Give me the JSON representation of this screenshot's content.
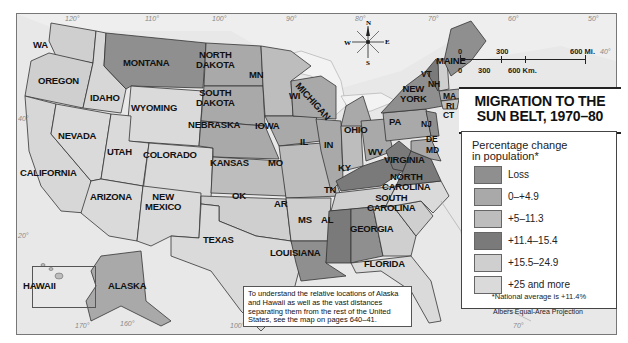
{
  "title": {
    "line1": "MIGRATION TO THE",
    "line2": "SUN BELT, 1970–80"
  },
  "scale": {
    "miles": [
      "0",
      "300",
      "600 Mi."
    ],
    "km": [
      "0",
      "300",
      "600 Km."
    ]
  },
  "compass": {
    "n": "N",
    "s": "S",
    "e": "E",
    "w": "W"
  },
  "legend": {
    "heading1": "Percentage change",
    "heading2": "in population*",
    "items": [
      {
        "label": "Loss",
        "color": "#8f8f8f"
      },
      {
        "label": "0–+4.9",
        "color": "#a9a9a9"
      },
      {
        "label": "+5–11.3",
        "color": "#bdbdbd"
      },
      {
        "label": "+11.4–15.4",
        "color": "#7a7a7a"
      },
      {
        "label": "+15.5–24.9",
        "color": "#cfcfcf"
      },
      {
        "label": "+25 and more",
        "color": "#dadada"
      }
    ],
    "note": "*National average is +11.4%",
    "projection": "Albers Equal-Area Projection"
  },
  "caption": "To understand the relative locations of Alaska and Hawaii as well as the vast distances separating them from the rest of the United States, see the map on pages 640–41.",
  "longitudes": [
    "120°",
    "110°",
    "100°",
    "90°",
    "80°",
    "70°",
    "60°",
    "50°",
    "40°",
    "30°",
    "100°",
    "70°",
    "160°",
    "170°",
    "110°",
    "160°",
    "20°",
    "60°",
    "70°"
  ],
  "latitudes": [
    "40°",
    "20°",
    "50°"
  ],
  "states": {
    "wa": "WA",
    "oregon": "OREGON",
    "california": "CALIFORNIA",
    "idaho": "IDAHO",
    "nevada": "NEVADA",
    "montana": "MONTANA",
    "wyoming": "WYOMING",
    "utah": "UTAH",
    "colorado": "COLORADO",
    "arizona": "ARIZONA",
    "new_mexico_1": "NEW",
    "new_mexico_2": "MEXICO",
    "north_dakota_1": "NORTH",
    "north_dakota_2": "DAKOTA",
    "south_dakota_1": "SOUTH",
    "south_dakota_2": "DAKOTA",
    "nebraska": "NEBRASKA",
    "kansas": "KANSAS",
    "ok": "OK",
    "texas": "TEXAS",
    "mn": "MN",
    "iowa": "IOWA",
    "mo": "MO",
    "ar": "AR",
    "louisiana": "LOUISIANA",
    "wi": "WI",
    "il": "IL",
    "michigan": "MICHIGAN",
    "in": "IN",
    "ohio": "OHIO",
    "ky": "KY",
    "tn": "TN",
    "ms": "MS",
    "al": "AL",
    "georgia": "GEORGIA",
    "florida": "FLORIDA",
    "south_carolina_1": "SOUTH",
    "south_carolina_2": "CAROLINA",
    "north_carolina_1": "NORTH",
    "north_carolina_2": "CAROLINA",
    "virginia": "VIRGINIA",
    "wv": "WV",
    "pa": "PA",
    "new_york_1": "NEW",
    "new_york_2": "YORK",
    "nj": "NJ",
    "de": "DE",
    "md": "MD",
    "vt": "VT",
    "nh": "NH",
    "maine": "MAINE",
    "ma": "MA",
    "ri": "RI",
    "ct": "CT",
    "alaska": "ALASKA",
    "hawaii": "HAWAII"
  }
}
